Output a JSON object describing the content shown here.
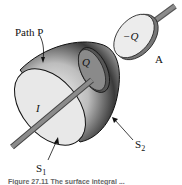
{
  "figure": {
    "labels": {
      "path": "Path P",
      "charge_pos": "Q",
      "charge_neg": "−Q",
      "plate": "A",
      "current": "I",
      "surface1": "S",
      "surface1_sub": "1",
      "surface2": "S",
      "surface2_sub": "2"
    },
    "caption_fragment": "Figure 27.11  The surface integral ..."
  },
  "colors": {
    "ink": "#111111",
    "surface_light": "#e6e6e6",
    "surface_dark": "#2a2a2a",
    "wire": "#8c8c8c"
  }
}
